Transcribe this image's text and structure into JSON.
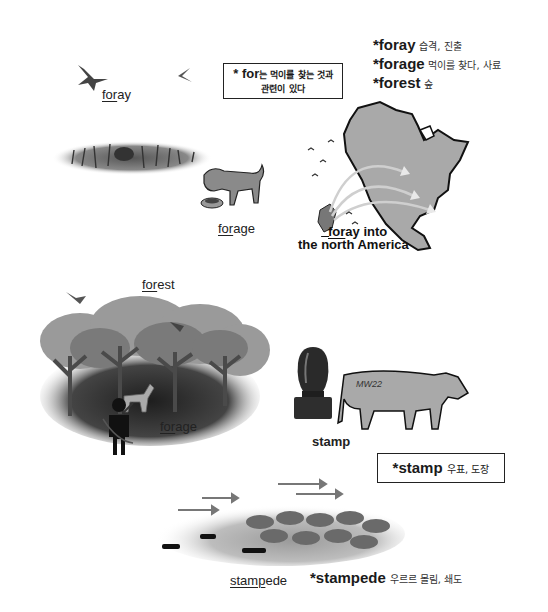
{
  "definitions_top": [
    {
      "word": "*foray",
      "meaning": "습격, 진출"
    },
    {
      "word": "*forage",
      "meaning": "먹이를 찾다, 사료"
    },
    {
      "word": "*forest",
      "meaning": "숲"
    }
  ],
  "note_box": {
    "prefix": "* for",
    "line1": "는 먹이를 찾는 것과",
    "line2": "관련이 있다"
  },
  "labels": {
    "foray_birds": {
      "underlined": "for",
      "rest": "ay"
    },
    "forage_dog": {
      "underlined": "for",
      "rest": "age"
    },
    "foray_map_line1": {
      "underlined": "for",
      "rest": "ay into"
    },
    "foray_map_line2_pre": "the ",
    "foray_map_line2_u": "n",
    "foray_map_line2_post": "orth America",
    "forest": {
      "underlined": "for",
      "rest": "est"
    },
    "forage_hunter": {
      "underlined": "for",
      "rest": "age"
    },
    "stamp": "stamp",
    "stampede": {
      "underlined": "stamp",
      "rest": "ede"
    }
  },
  "cow_brand": "MW22",
  "stamp_box": {
    "word": "*stamp",
    "meaning": "우표, 도장"
  },
  "stampede_def": {
    "word": "*stampede",
    "meaning": "우르르 몰림, 쇄도"
  },
  "colors": {
    "ink": "#1a1a1a",
    "map_fill": "#a9a9a9",
    "tree_light": "#9a9a9a",
    "tree_dark": "#3a3a3a"
  }
}
